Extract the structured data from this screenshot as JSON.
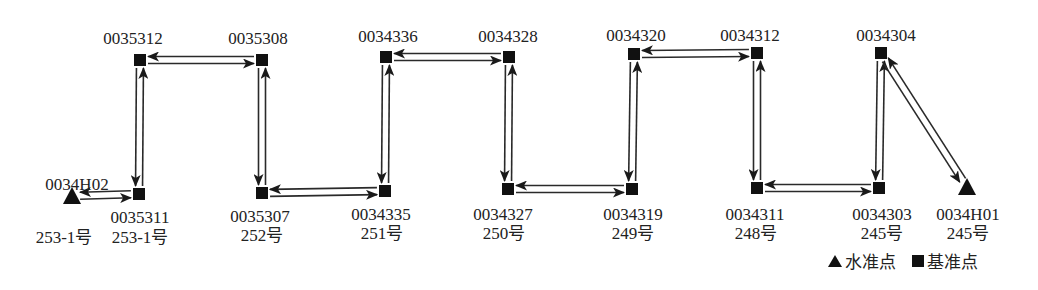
{
  "diagram": {
    "title": "",
    "nodes": [
      {
        "id": "0034H02",
        "type": "benchmark",
        "x": 72,
        "y": 196,
        "sub": "253-1号"
      },
      {
        "id": "0035311",
        "type": "base",
        "x": 139,
        "y": 194,
        "sub": "253-1号"
      },
      {
        "id": "0035312",
        "type": "base",
        "x": 140,
        "y": 60,
        "sub": ""
      },
      {
        "id": "0035308",
        "type": "base",
        "x": 262,
        "y": 60,
        "sub": ""
      },
      {
        "id": "0035307",
        "type": "base",
        "x": 262,
        "y": 193,
        "sub": "252号"
      },
      {
        "id": "0034335",
        "type": "base",
        "x": 385,
        "y": 191,
        "sub": "251号"
      },
      {
        "id": "0034336",
        "type": "base",
        "x": 386,
        "y": 57,
        "sub": ""
      },
      {
        "id": "0034328",
        "type": "base",
        "x": 509,
        "y": 57,
        "sub": ""
      },
      {
        "id": "0034327",
        "type": "base",
        "x": 508,
        "y": 189,
        "sub": "250号"
      },
      {
        "id": "0034319",
        "type": "base",
        "x": 632,
        "y": 189,
        "sub": "249号"
      },
      {
        "id": "0034320",
        "type": "base",
        "x": 634,
        "y": 54,
        "sub": ""
      },
      {
        "id": "0034312",
        "type": "base",
        "x": 757,
        "y": 53,
        "sub": ""
      },
      {
        "id": "0034311",
        "type": "base",
        "x": 757,
        "y": 188,
        "sub": "248号"
      },
      {
        "id": "0034303",
        "type": "base",
        "x": 879,
        "y": 188,
        "sub": "245号"
      },
      {
        "id": "0034304",
        "type": "base",
        "x": 881,
        "y": 53,
        "sub": ""
      },
      {
        "id": "0034H01",
        "type": "benchmark",
        "x": 967,
        "y": 187,
        "sub": "245号"
      }
    ],
    "edges": [
      [
        "0034H02",
        "0035311"
      ],
      [
        "0035311",
        "0035312"
      ],
      [
        "0035312",
        "0035308"
      ],
      [
        "0035308",
        "0035307"
      ],
      [
        "0035307",
        "0034335"
      ],
      [
        "0034335",
        "0034336"
      ],
      [
        "0034336",
        "0034328"
      ],
      [
        "0034328",
        "0034327"
      ],
      [
        "0034327",
        "0034319"
      ],
      [
        "0034319",
        "0034320"
      ],
      [
        "0034320",
        "0034312"
      ],
      [
        "0034312",
        "0034311"
      ],
      [
        "0034311",
        "0034303"
      ],
      [
        "0034303",
        "0034304"
      ],
      [
        "0034304",
        "0034H01"
      ]
    ],
    "edge_style": "double line, round-trip (forward and return arrows)",
    "colors": {
      "line": "#2a2a2a",
      "marker": "#111111",
      "text": "#222222",
      "background": "#ffffff"
    }
  },
  "labels": [
    {
      "key": "0035312",
      "text": "0035312",
      "x": 133,
      "y": 30
    },
    {
      "key": "0035308",
      "text": "0035308",
      "x": 258,
      "y": 30
    },
    {
      "key": "0034336",
      "text": "0034336",
      "x": 388,
      "y": 28
    },
    {
      "key": "0034328",
      "text": "0034328",
      "x": 508,
      "y": 28
    },
    {
      "key": "0034320",
      "text": "0034320",
      "x": 636,
      "y": 27
    },
    {
      "key": "0034312",
      "text": "0034312",
      "x": 750,
      "y": 27
    },
    {
      "key": "0034304",
      "text": "0034304",
      "x": 886,
      "y": 27
    },
    {
      "key": "0034H02",
      "text": "0034H02",
      "x": 77,
      "y": 176
    },
    {
      "key": "0035311",
      "text": "0035311",
      "x": 140,
      "y": 209
    },
    {
      "key": "0035307",
      "text": "0035307",
      "x": 260,
      "y": 208
    },
    {
      "key": "0034335",
      "text": "0034335",
      "x": 381,
      "y": 206
    },
    {
      "key": "0034327",
      "text": "0034327",
      "x": 503,
      "y": 206
    },
    {
      "key": "0034319",
      "text": "0034319",
      "x": 633,
      "y": 206
    },
    {
      "key": "0034311",
      "text": "0034311",
      "x": 755,
      "y": 206
    },
    {
      "key": "0034303",
      "text": "0034303",
      "x": 882,
      "y": 206
    },
    {
      "key": "0034H01",
      "text": "0034H01",
      "x": 968,
      "y": 206
    },
    {
      "key": "sub-0034H02",
      "text": "253-1号",
      "x": 64,
      "y": 229
    },
    {
      "key": "sub-0035311",
      "text": "253-1号",
      "x": 140,
      "y": 229
    },
    {
      "key": "sub-0035307",
      "text": "252号",
      "x": 262,
      "y": 227
    },
    {
      "key": "sub-0034335",
      "text": "251号",
      "x": 382,
      "y": 225
    },
    {
      "key": "sub-0034327",
      "text": "250号",
      "x": 504,
      "y": 225
    },
    {
      "key": "sub-0034319",
      "text": "249号",
      "x": 633,
      "y": 225
    },
    {
      "key": "sub-0034311",
      "text": "248号",
      "x": 756,
      "y": 225
    },
    {
      "key": "sub-0034303",
      "text": "245号",
      "x": 882,
      "y": 225
    },
    {
      "key": "sub-0034H01",
      "text": "245号",
      "x": 968,
      "y": 225
    }
  ],
  "legend": {
    "items": [
      {
        "symbol": "triangle",
        "label": "水准点"
      },
      {
        "symbol": "square",
        "label": "基准点"
      }
    ]
  }
}
